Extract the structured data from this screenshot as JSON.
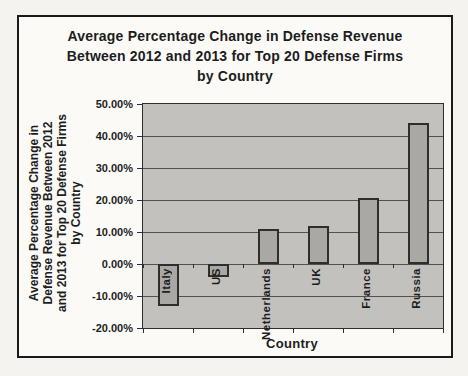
{
  "chart": {
    "title_lines": [
      "Average Percentage Change in Defense Revenue",
      "Between 2012 and 2013 for Top 20 Defense Firms",
      "by Country"
    ],
    "y_axis_title_lines": [
      "Average Percentage Change in",
      "Defense Revenue Between 2012",
      "and 2013 for Top 20 Defense Firms",
      "by Country"
    ]
  },
  "chart_data": {
    "type": "bar",
    "title": "Average Percentage Change in Defense Revenue Between 2012 and 2013 for Top 20 Defense Firms by Country",
    "categories": [
      "Italy",
      "US",
      "Netherlands",
      "UK",
      "France",
      "Russia"
    ],
    "values": [
      -13,
      -4,
      11,
      12,
      20.5,
      44
    ],
    "value_unit": "percent",
    "xlabel": "Country",
    "ylabel": "Average Percentage Change in Defense Revenue Between 2012 and 2013 for Top 20 Defense Firms by Country",
    "ylim": [
      -20,
      50
    ],
    "ytick_step": 10,
    "yticks": [
      "50.00%",
      "40.00%",
      "30.00%",
      "20.00%",
      "10.00%",
      "0.00%",
      "-10.00%",
      "-20.00%"
    ],
    "grid": true,
    "legend": "none",
    "colors": {
      "page_bg": "#f4f3f0",
      "frame_bg": "#fbfaf7",
      "plot_bg": "#c2c1bd",
      "bar_fill": "#a9a8a4",
      "bar_border": "#2e2e2c",
      "gridline": "#53524e",
      "axis": "#2e2e2c",
      "text": "#1d1d1d"
    }
  }
}
